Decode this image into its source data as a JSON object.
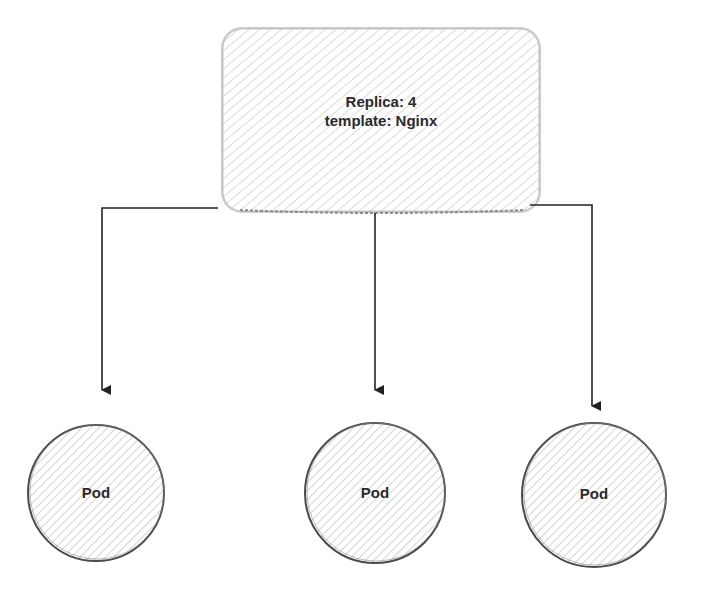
{
  "diagram": {
    "type": "kubernetes-replicaset",
    "replicaset": {
      "line1": "Replica: 4",
      "line2": "template: Nginx"
    },
    "pods": [
      {
        "label": "Pod"
      },
      {
        "label": "Pod"
      },
      {
        "label": "Pod"
      }
    ],
    "edges": [
      {
        "from": "replicaset",
        "to": "pod-1"
      },
      {
        "from": "replicaset",
        "to": "pod-2"
      },
      {
        "from": "replicaset",
        "to": "pod-3"
      }
    ],
    "colors": {
      "stroke": "#555555",
      "hatch": "#b8b8b8",
      "arrow": "#222222",
      "text": "#2b2b2b"
    }
  }
}
